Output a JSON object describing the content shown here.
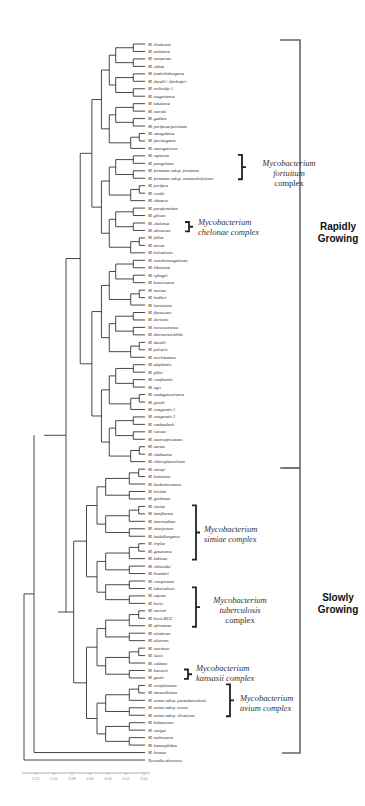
{
  "leaves": [
    "M. rhodesiae",
    "M. aichiense",
    "M. neoaurum",
    "M. chitae",
    "M. frederiksbergense",
    "M. duvalii / dierhoferi",
    "M. wolinskyi 1",
    "M. mageritense",
    "M. tokaiense",
    "M. murale",
    "M. gadium",
    "M. poriferae/porcinum",
    "M. senegalense",
    "M. farcinogenes",
    "M. mucogenicum",
    "M. septicum",
    "M. peregrinum",
    "M. fortuitum subsp. fortuitum",
    "M. fortuitum subsp. acetamidolyticum",
    "M. porifera",
    "M. cookii",
    "M. obuense",
    "M. parafortuitum",
    "M. gilvum",
    "M. chelonae",
    "M. abscessus",
    "M. fallax",
    "M. terrae",
    "M. holsaticum",
    "M. nonchromogenicum",
    "M. hiberniae",
    "M. sphagni",
    "M. komossense",
    "M. tusciae",
    "M. hodleri",
    "M. hassiacum",
    "M. flavescens",
    "M. doricum",
    "M. novocastrense",
    "M. thermoresistibile",
    "M. duvalii",
    "M. pulveris",
    "M. moriokaense",
    "M. elephantis",
    "M. phlei",
    "M. confluentis",
    "M. agri",
    "M. madagascariense",
    "M. goodii",
    "M. smegmatis 1",
    "M. smegmatis 2",
    "M. vanbaalenii",
    "M. vaccae",
    "M. austroafricanum",
    "M. aurum",
    "M. chubuense",
    "M. chlorophenolicum",
    "M. xenopi",
    "M. botniense",
    "M. heckeshornense",
    "M. triviale",
    "M. gordonae",
    "M. simiae",
    "M. lentiflavum",
    "M. intermedium",
    "M. interjectum",
    "M. heidelbergense",
    "M. triplex",
    "M. genavense",
    "M. kubicae",
    "M. shimoidei",
    "M. branderi",
    "M. conspicuum",
    "M. tuberculosis",
    "M. caprae",
    "M. bovis",
    "M. microti",
    "M. bovis BCG",
    "M. africanum",
    "M. asiaticum",
    "M. ulcerans",
    "M. marinum",
    "M. lacus",
    "M. celatum",
    "M. kansasii",
    "M. gastri",
    "M. scrofulaceum",
    "M. intracellulare",
    "M. avium subsp. paratuberculosis",
    "M. avium subsp. avium",
    "M. avium subsp. silvaticum",
    "M. bohemicum",
    "M. szulgai",
    "M. malmoense",
    "M. haemophilum",
    "M. branae",
    "Nocardia abscessus"
  ],
  "groups": [
    {
      "name": "fortuitum-complex",
      "line1": "Mycobacterium",
      "line2": "fortuitum",
      "line3": "complex"
    },
    {
      "name": "chelonae-complex",
      "line1": "Mycobacterium",
      "line2": "chelonae complex"
    },
    {
      "name": "simiae-complex",
      "line1": "Mycobacterium",
      "line2": "simiae complex"
    },
    {
      "name": "tuberculosis-complex",
      "line1": "Mycobacterium",
      "line2": "tuberculosis",
      "line3": "complex"
    },
    {
      "name": "kansasii-complex",
      "line1": "Mycobacterium",
      "line2": "kansasii complex"
    },
    {
      "name": "avium-complex",
      "line1": "Mycobacterium",
      "line2": "avium complex"
    }
  ],
  "growth": {
    "rapid": {
      "line1": "Rapidly",
      "line2": "Growing"
    },
    "slow": {
      "line1": "Slowly",
      "line2": "Growing"
    }
  },
  "scale": {
    "ticks": [
      "0.12",
      "0.10",
      "0.08",
      "0.06",
      "0.04",
      "0.02",
      "0.00"
    ]
  }
}
